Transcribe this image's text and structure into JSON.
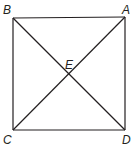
{
  "figure": {
    "type": "square-with-diagonals",
    "stroke_color": "#231f20",
    "background": "#ffffff",
    "points": {
      "A": {
        "label": "A",
        "x": 125,
        "y": 17
      },
      "B": {
        "label": "B",
        "x": 13,
        "y": 18
      },
      "C": {
        "label": "C",
        "x": 13,
        "y": 130
      },
      "D": {
        "label": "D",
        "x": 125,
        "y": 130
      },
      "E": {
        "label": "E",
        "x": 69,
        "y": 74
      }
    },
    "segments": [
      "BA",
      "AD",
      "DC",
      "CB",
      "BD",
      "AC"
    ]
  }
}
